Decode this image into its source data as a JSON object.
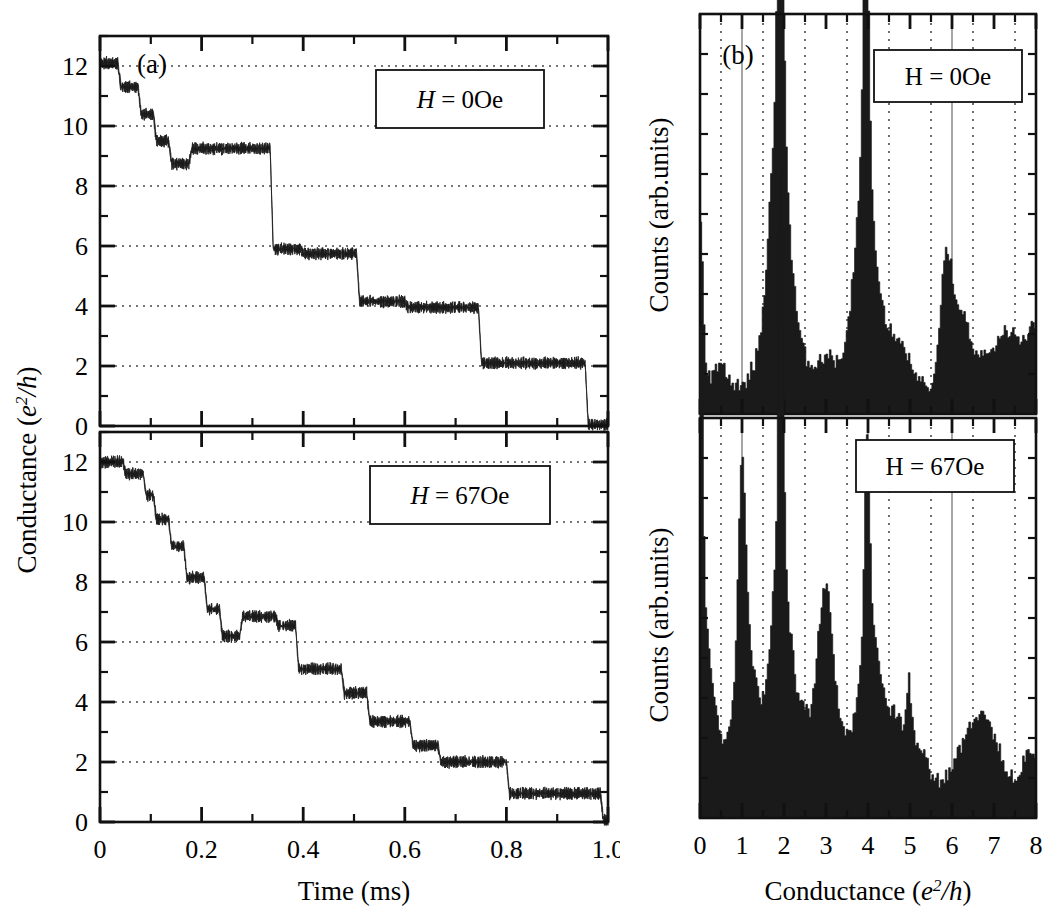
{
  "figure": {
    "panels": [
      {
        "id": "(a)",
        "axes": {
          "xlabel": "Time (ms)",
          "ylabel_prefix": "Conductance (",
          "ylabel_math": "e",
          "ylabel_exp": "2",
          "ylabel_den": "/h",
          "ylabel_suffix": ")",
          "xticks": [
            "0",
            "0.2",
            "0.4",
            "0.6",
            "0.8",
            "1.0"
          ],
          "yticks": [
            "0",
            "2",
            "4",
            "6",
            "8",
            "10",
            "12"
          ]
        },
        "subpanels": [
          {
            "annotation_var": "H",
            "annotation_eq": " = ",
            "annotation_val": "0Oe",
            "annotation_italic": true
          },
          {
            "annotation_var": "H",
            "annotation_eq": " = ",
            "annotation_val": "67Oe",
            "annotation_italic": true
          }
        ]
      },
      {
        "id": "(b)",
        "axes": {
          "xlabel_prefix": "Conductance (",
          "xlabel_math": "e",
          "xlabel_exp": "2",
          "xlabel_den": "/h",
          "xlabel_suffix": ")",
          "ylabel": "Counts (arb.units)",
          "xticks": [
            "0",
            "1",
            "2",
            "3",
            "4",
            "5",
            "6",
            "7",
            "8"
          ]
        },
        "subpanels": [
          {
            "annotation_var": "H",
            "annotation_eq": " = ",
            "annotation_val": "0Oe",
            "annotation_italic": false
          },
          {
            "annotation_var": "H",
            "annotation_eq": " = ",
            "annotation_val": "67Oe",
            "annotation_italic": false
          }
        ]
      }
    ],
    "colors": {
      "ink": "#1a1a1a",
      "axis": "#111111",
      "grid": "#4a4a4a",
      "background": "#ffffff"
    }
  },
  "chart_data": [
    {
      "type": "line",
      "panel": "a-top",
      "title": "Conductance vs time, H = 0Oe",
      "xlabel": "Time (ms)",
      "ylabel": "Conductance (e2/h)",
      "xlim": [
        0,
        1.0
      ],
      "ylim": [
        0,
        13
      ],
      "grid": true,
      "annotation": "H = 0Oe",
      "noise_amplitude": 0.22,
      "plateaus": [
        {
          "x0": 0.0,
          "x1": 0.035,
          "level": 12.1
        },
        {
          "x0": 0.035,
          "x1": 0.075,
          "level": 11.3
        },
        {
          "x0": 0.075,
          "x1": 0.105,
          "level": 10.4
        },
        {
          "x0": 0.105,
          "x1": 0.135,
          "level": 9.5
        },
        {
          "x0": 0.135,
          "x1": 0.175,
          "level": 8.75
        },
        {
          "x0": 0.175,
          "x1": 0.335,
          "level": 9.25
        },
        {
          "x0": 0.335,
          "x1": 0.395,
          "level": 5.9
        },
        {
          "x0": 0.395,
          "x1": 0.505,
          "level": 5.75
        },
        {
          "x0": 0.505,
          "x1": 0.6,
          "level": 4.15
        },
        {
          "x0": 0.6,
          "x1": 0.745,
          "level": 3.95
        },
        {
          "x0": 0.745,
          "x1": 0.955,
          "level": 2.1
        },
        {
          "x0": 0.955,
          "x1": 1.0,
          "level": 0.05
        }
      ]
    },
    {
      "type": "line",
      "panel": "a-bottom",
      "title": "Conductance vs time, H = 67Oe",
      "xlabel": "Time (ms)",
      "ylabel": "Conductance (e2/h)",
      "xlim": [
        0,
        1.0
      ],
      "ylim": [
        0,
        13
      ],
      "grid": true,
      "annotation": "H = 67Oe",
      "noise_amplitude": 0.22,
      "plateaus": [
        {
          "x0": 0.0,
          "x1": 0.045,
          "level": 12.0
        },
        {
          "x0": 0.045,
          "x1": 0.085,
          "level": 11.6
        },
        {
          "x0": 0.085,
          "x1": 0.105,
          "level": 10.9
        },
        {
          "x0": 0.105,
          "x1": 0.135,
          "level": 10.1
        },
        {
          "x0": 0.135,
          "x1": 0.165,
          "level": 9.2
        },
        {
          "x0": 0.165,
          "x1": 0.205,
          "level": 8.15
        },
        {
          "x0": 0.205,
          "x1": 0.235,
          "level": 7.1
        },
        {
          "x0": 0.235,
          "x1": 0.275,
          "level": 6.2
        },
        {
          "x0": 0.275,
          "x1": 0.345,
          "level": 6.85
        },
        {
          "x0": 0.345,
          "x1": 0.385,
          "level": 6.55
        },
        {
          "x0": 0.385,
          "x1": 0.475,
          "level": 5.1
        },
        {
          "x0": 0.475,
          "x1": 0.525,
          "level": 4.3
        },
        {
          "x0": 0.525,
          "x1": 0.61,
          "level": 3.35
        },
        {
          "x0": 0.61,
          "x1": 0.665,
          "level": 2.55
        },
        {
          "x0": 0.665,
          "x1": 0.8,
          "level": 2.0
        },
        {
          "x0": 0.8,
          "x1": 0.985,
          "level": 0.95
        },
        {
          "x0": 0.985,
          "x1": 1.0,
          "level": 0.05
        }
      ]
    },
    {
      "type": "bar",
      "panel": "b-top",
      "title": "Conductance histogram, H = 0Oe",
      "xlabel": "Conductance (e2/h)",
      "ylabel": "Counts (arb.units)",
      "xlim": [
        0,
        8
      ],
      "ylim": [
        0,
        100
      ],
      "grid": true,
      "annotation": "H = 0Oe",
      "bin_width": 0.04,
      "peaks": [
        {
          "center": 0.02,
          "height": 40,
          "width": 0.06,
          "label": "edge spike at 0"
        },
        {
          "center": 0.45,
          "height": 5,
          "width": 0.18
        },
        {
          "center": 1.92,
          "height": 95,
          "width": 0.055,
          "label": "main peak at 2"
        },
        {
          "center": 1.88,
          "height": 46,
          "width": 0.17
        },
        {
          "center": 1.8,
          "height": 24,
          "width": 0.3
        },
        {
          "center": 2.15,
          "height": 14,
          "width": 0.28
        },
        {
          "center": 3.02,
          "height": 7,
          "width": 0.22
        },
        {
          "center": 3.96,
          "height": 62,
          "width": 0.06,
          "label": "peak at 4"
        },
        {
          "center": 3.92,
          "height": 34,
          "width": 0.18
        },
        {
          "center": 3.85,
          "height": 19,
          "width": 0.3
        },
        {
          "center": 4.2,
          "height": 12,
          "width": 0.3
        },
        {
          "center": 4.75,
          "height": 9,
          "width": 0.25
        },
        {
          "center": 5.85,
          "height": 23,
          "width": 0.12,
          "label": "peak at 6"
        },
        {
          "center": 6.05,
          "height": 14,
          "width": 0.22
        },
        {
          "center": 6.35,
          "height": 10,
          "width": 0.25
        },
        {
          "center": 7.1,
          "height": 9,
          "width": 0.3
        },
        {
          "center": 7.55,
          "height": 11,
          "width": 0.28
        },
        {
          "center": 7.95,
          "height": 12,
          "width": 0.12
        }
      ],
      "baseline": 4
    },
    {
      "type": "bar",
      "panel": "b-bottom",
      "title": "Conductance histogram, H = 67Oe",
      "xlabel": "Conductance (e2/h)",
      "ylabel": "Counts (arb.units)",
      "xlim": [
        0,
        8
      ],
      "ylim": [
        0,
        100
      ],
      "grid": true,
      "annotation": "H = 67Oe",
      "bin_width": 0.04,
      "peaks": [
        {
          "center": 0.03,
          "height": 88,
          "width": 0.045,
          "label": "edge spike at 0"
        },
        {
          "center": 0.12,
          "height": 30,
          "width": 0.14
        },
        {
          "center": 0.28,
          "height": 13,
          "width": 0.22
        },
        {
          "center": 1.0,
          "height": 43,
          "width": 0.075,
          "label": "peak at 1"
        },
        {
          "center": 1.05,
          "height": 26,
          "width": 0.2
        },
        {
          "center": 1.1,
          "height": 16,
          "width": 0.38
        },
        {
          "center": 1.93,
          "height": 92,
          "width": 0.05,
          "label": "main peak at 2"
        },
        {
          "center": 1.9,
          "height": 36,
          "width": 0.17
        },
        {
          "center": 1.88,
          "height": 20,
          "width": 0.33
        },
        {
          "center": 2.25,
          "height": 13,
          "width": 0.28
        },
        {
          "center": 2.98,
          "height": 30,
          "width": 0.16,
          "label": "peak at 3"
        },
        {
          "center": 3.05,
          "height": 21,
          "width": 0.38
        },
        {
          "center": 3.98,
          "height": 50,
          "width": 0.06,
          "label": "peak at 4"
        },
        {
          "center": 4.05,
          "height": 26,
          "width": 0.22
        },
        {
          "center": 4.15,
          "height": 16,
          "width": 0.38
        },
        {
          "center": 4.72,
          "height": 12,
          "width": 0.22
        },
        {
          "center": 4.98,
          "height": 15,
          "width": 0.05
        },
        {
          "center": 5.2,
          "height": 10,
          "width": 0.25
        },
        {
          "center": 6.45,
          "height": 14,
          "width": 0.35
        },
        {
          "center": 6.9,
          "height": 10,
          "width": 0.3
        },
        {
          "center": 7.9,
          "height": 10,
          "width": 0.2
        }
      ],
      "baseline": 4
    }
  ]
}
